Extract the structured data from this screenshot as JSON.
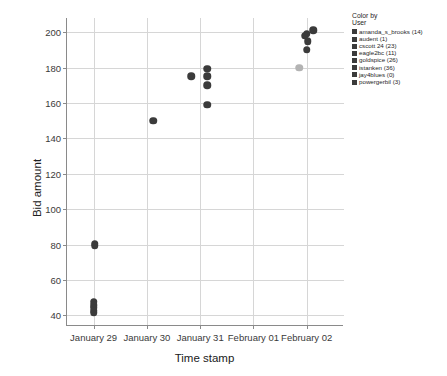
{
  "chart_data": {
    "type": "scatter",
    "title": "",
    "xlabel": "Time stamp",
    "ylabel": "Bid amount",
    "grid": true,
    "legend_position": "top-right",
    "x_tick_labels": [
      "January 29",
      "January 30",
      "January 31",
      "February 01",
      "February 02"
    ],
    "y_tick_labels": [
      "40",
      "60",
      "80",
      "100",
      "120",
      "140",
      "160",
      "180",
      "200"
    ],
    "y_ticks": [
      40,
      60,
      80,
      100,
      120,
      140,
      160,
      180,
      200
    ],
    "ylim": [
      34,
      208
    ],
    "xlim": [
      0,
      5.2
    ],
    "series": [
      {
        "name": "default",
        "color": "#3b3b3b",
        "points": [
          {
            "x": 0.52,
            "y": 80.4
          },
          {
            "x": 0.52,
            "y": 79.2
          },
          {
            "x": 0.5,
            "y": 47.6
          },
          {
            "x": 0.5,
            "y": 45.8
          },
          {
            "x": 0.5,
            "y": 44.2
          },
          {
            "x": 0.5,
            "y": 42.6
          },
          {
            "x": 0.5,
            "y": 41.4
          },
          {
            "x": 1.62,
            "y": 150.0
          },
          {
            "x": 2.33,
            "y": 175.0
          },
          {
            "x": 2.63,
            "y": 179.4
          },
          {
            "x": 2.63,
            "y": 175.0
          },
          {
            "x": 2.63,
            "y": 170.0
          },
          {
            "x": 2.63,
            "y": 159.0
          },
          {
            "x": 4.62,
            "y": 201.0
          },
          {
            "x": 4.5,
            "y": 199.0
          },
          {
            "x": 4.46,
            "y": 198.0
          },
          {
            "x": 4.52,
            "y": 195.0
          },
          {
            "x": 4.5,
            "y": 190.0
          }
        ]
      },
      {
        "name": "gray",
        "color": "#b3b3b3",
        "points": [
          {
            "x": 4.36,
            "y": 180.0
          }
        ]
      }
    ]
  },
  "legend": {
    "title": "Color by",
    "subtitle": "User",
    "items": [
      {
        "label": "amanda_s_brooks (14)",
        "color": "#3b3b3b"
      },
      {
        "label": "audent (1)",
        "color": "#3b3b3b"
      },
      {
        "label": "cscott 24 (23)",
        "color": "#3b3b3b"
      },
      {
        "label": "eagle2bc (11)",
        "color": "#3b3b3b"
      },
      {
        "label": "goldspice (26)",
        "color": "#3b3b3b"
      },
      {
        "label": "istanken (36)",
        "color": "#3b3b3b"
      },
      {
        "label": "jay4blues (0)",
        "color": "#3b3b3b"
      },
      {
        "label": "powergerbil (3)",
        "color": "#3b3b3b"
      }
    ]
  }
}
